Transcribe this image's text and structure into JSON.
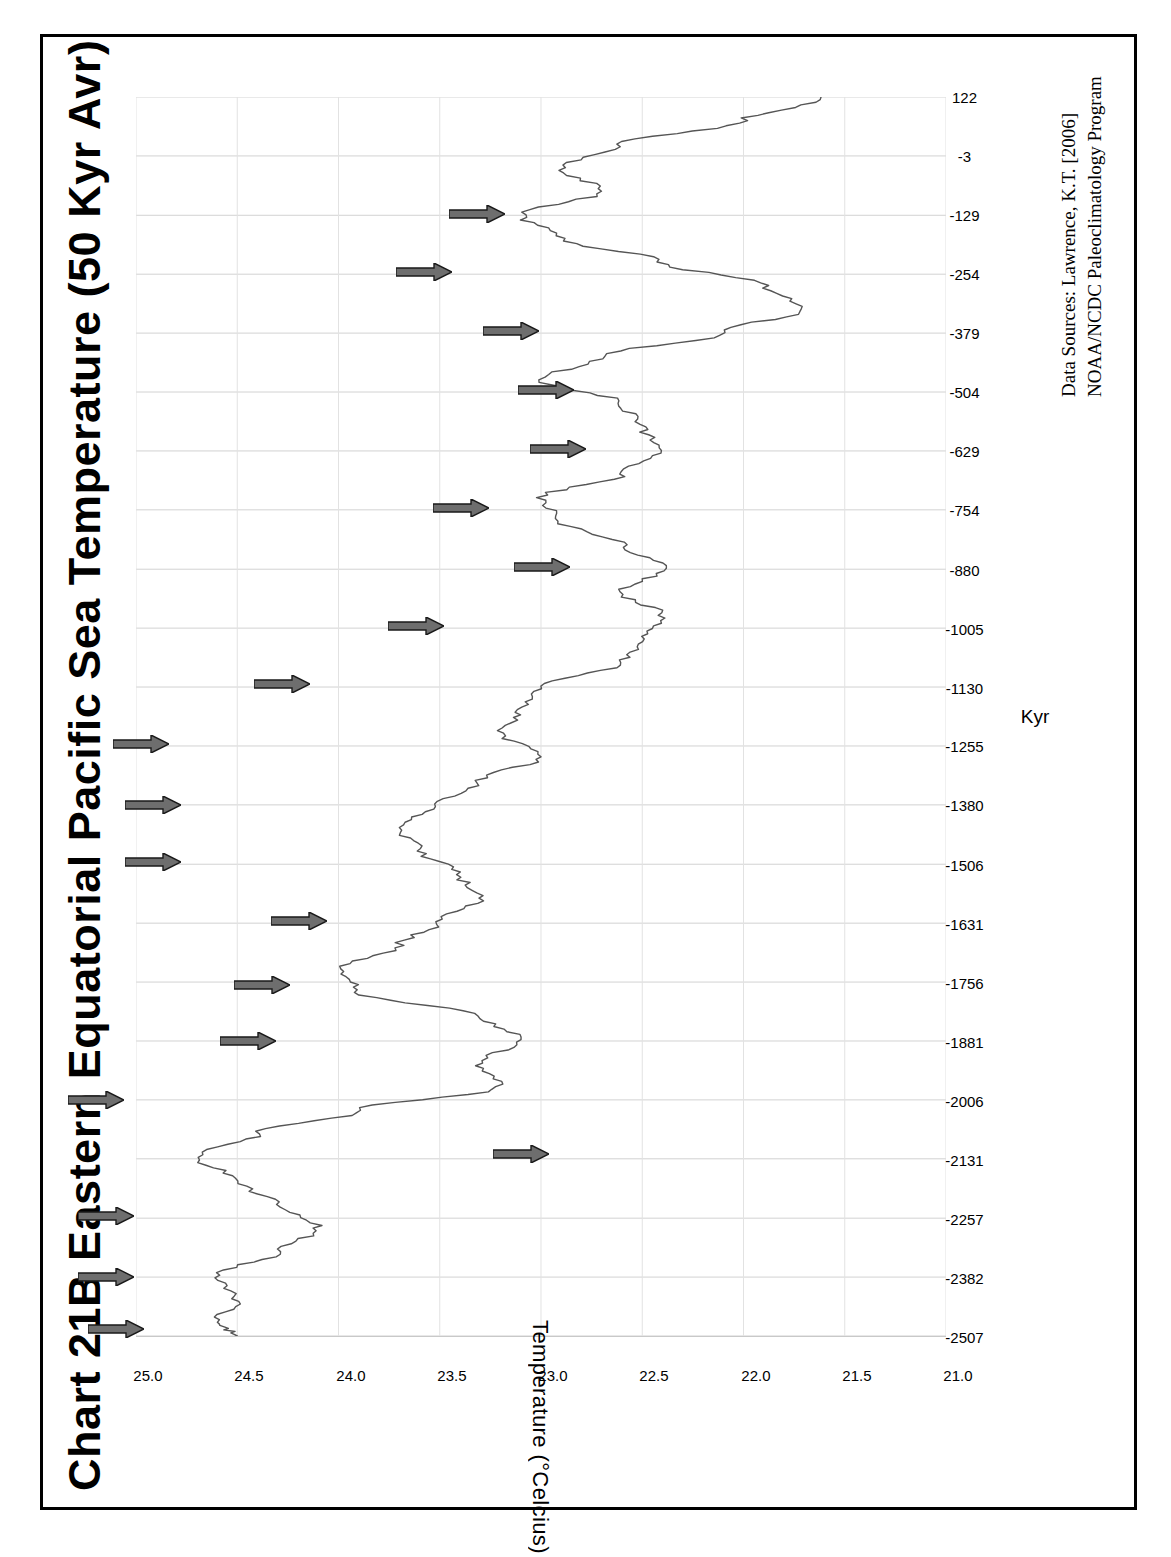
{
  "page": {
    "background": "#ffffff",
    "frame_color": "#000000"
  },
  "title": {
    "prefix": "Chart 21B",
    "text": "Chart 21B  Eastern Equatorial Pacific Sea Temperature (50 Kyr Avr)"
  },
  "source_note": {
    "line1": "Data Sources:  Lawrence, K.T. [2006]",
    "line2": "NOAA/NCDC Paleoclimatology Program"
  },
  "axes": {
    "x_title": "Kyr",
    "y_title": "Temperature (°Celcius)"
  },
  "chart_data": {
    "type": "line",
    "orientation": "rotated-90ccw",
    "title": "Chart 21B  Eastern Equatorial Pacific Sea Temperature (50 Kyr Avr)",
    "xlabel": "Kyr",
    "ylabel": "Temperature (°Celcius)",
    "grid": true,
    "legend": "none",
    "series_name": "Eastern Equatorial Pacific Sea Surface Temperature (50 Kyr average)",
    "line_color": "#555555",
    "xlim": [
      -2507,
      122
    ],
    "ylim": [
      21.0,
      25.0
    ],
    "xticks": [
      122,
      -3,
      -129,
      -254,
      -379,
      -504,
      -629,
      -754,
      -880,
      -1005,
      -1130,
      -1255,
      -1380,
      -1506,
      -1631,
      -1756,
      -1881,
      -2006,
      -2131,
      -2257,
      -2382,
      -2507
    ],
    "yticks": [
      "25.0",
      "24.5",
      "24.0",
      "23.5",
      "23.0",
      "22.5",
      "22.0",
      "21.5",
      "21.0"
    ],
    "ytick_values": [
      25.0,
      24.5,
      24.0,
      23.5,
      23.0,
      22.5,
      22.0,
      21.5,
      21.0
    ],
    "annotations": {
      "marker": "right-pointing-arrow",
      "marker_color": "#6e6e6e",
      "marker_outline": "#1a1a1a",
      "count": 18,
      "note": "arrows flag interglacial warm peaks",
      "kyr_positions": [
        -2490,
        -2380,
        -2250,
        -2120,
        -2005,
        -1880,
        -1760,
        -1625,
        -1500,
        -1380,
        -1250,
        -1125,
        -1000,
        -875,
        -750,
        -625,
        -500,
        -375,
        -250,
        -125
      ]
    },
    "x": [
      122,
      72,
      22,
      -28,
      -78,
      -128,
      -178,
      -228,
      -278,
      -328,
      -378,
      -428,
      -478,
      -528,
      -578,
      -628,
      -678,
      -728,
      -778,
      -828,
      -878,
      -928,
      -978,
      -1028,
      -1078,
      -1128,
      -1178,
      -1228,
      -1278,
      -1328,
      -1378,
      -1428,
      -1478,
      -1528,
      -1578,
      -1628,
      -1678,
      -1728,
      -1778,
      -1828,
      -1878,
      -1928,
      -1978,
      -2028,
      -2078,
      -2128,
      -2178,
      -2228,
      -2278,
      -2328,
      -2378,
      -2428,
      -2478,
      -2507
    ],
    "y": [
      21.6,
      22.0,
      22.6,
      22.9,
      22.7,
      23.1,
      22.9,
      22.4,
      21.9,
      21.7,
      22.1,
      22.7,
      23.0,
      22.6,
      22.5,
      22.4,
      22.6,
      23.0,
      22.9,
      22.6,
      22.4,
      22.6,
      22.4,
      22.5,
      22.6,
      23.0,
      23.1,
      23.2,
      23.0,
      23.3,
      23.5,
      23.7,
      23.6,
      23.4,
      23.3,
      23.5,
      23.7,
      24.0,
      23.9,
      23.3,
      23.1,
      23.3,
      23.2,
      23.9,
      24.4,
      24.7,
      24.5,
      24.3,
      24.1,
      24.3,
      24.6,
      24.5,
      24.6,
      24.5
    ],
    "series": [
      {
        "name": "Sea surface temperature",
        "unit": "°C",
        "approx_min": 21.6,
        "approx_max": 24.75
      }
    ]
  },
  "ticks": {
    "x": [
      "122",
      "-3",
      "-129",
      "-254",
      "-379",
      "-504",
      "-629",
      "-754",
      "-880",
      "-1005",
      "-1130",
      "-1255",
      "-1380",
      "-1506",
      "-1631",
      "-1756",
      "-1881",
      "-2006",
      "-2131",
      "-2257",
      "-2382",
      "-2507"
    ],
    "y": [
      "25.0",
      "24.5",
      "24.0",
      "23.5",
      "23.0",
      "22.5",
      "22.0",
      "21.5",
      "21.0"
    ]
  }
}
